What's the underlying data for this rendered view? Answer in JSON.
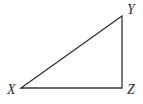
{
  "diagram": {
    "type": "right-triangle",
    "stroke_color": "#333333",
    "background": "#ffffff",
    "vertices": [
      {
        "name": "X",
        "x": 21,
        "y": 88,
        "label_x": 7,
        "label_y": 94
      },
      {
        "name": "Y",
        "x": 122,
        "y": 16,
        "label_x": 127,
        "label_y": 14
      },
      {
        "name": "Z",
        "x": 122,
        "y": 88,
        "label_x": 127,
        "label_y": 94
      }
    ],
    "right_angle_at": "Z",
    "edges": [
      [
        "X",
        "Y"
      ],
      [
        "Y",
        "Z"
      ],
      [
        "Z",
        "X"
      ]
    ]
  }
}
